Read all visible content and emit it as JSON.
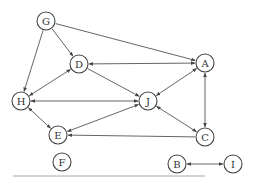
{
  "diagram": {
    "type": "directed-graph",
    "node_radius": 9,
    "colors": {
      "stroke": "#444444",
      "edge": "#555555",
      "text": "#333333",
      "divider": "#aaaaaa",
      "background": "#ffffff"
    },
    "nodes": [
      {
        "id": "G",
        "label": "G",
        "x": 46,
        "y": 21
      },
      {
        "id": "D",
        "label": "D",
        "x": 79,
        "y": 64
      },
      {
        "id": "A",
        "label": "A",
        "x": 205,
        "y": 63
      },
      {
        "id": "H",
        "label": "H",
        "x": 21,
        "y": 101
      },
      {
        "id": "J",
        "label": "J",
        "x": 148,
        "y": 101
      },
      {
        "id": "E",
        "label": "E",
        "x": 58,
        "y": 135
      },
      {
        "id": "C",
        "label": "C",
        "x": 205,
        "y": 137
      },
      {
        "id": "F",
        "label": "F",
        "x": 62,
        "y": 162
      },
      {
        "id": "B",
        "label": "B",
        "x": 177,
        "y": 164
      },
      {
        "id": "I",
        "label": "I",
        "x": 233,
        "y": 164
      }
    ],
    "edges": [
      {
        "from": "G",
        "to": "D",
        "bidirectional": false
      },
      {
        "from": "G",
        "to": "H",
        "bidirectional": false
      },
      {
        "from": "G",
        "to": "A",
        "bidirectional": false
      },
      {
        "from": "A",
        "to": "D",
        "bidirectional": true
      },
      {
        "from": "D",
        "to": "J",
        "bidirectional": false
      },
      {
        "from": "A",
        "to": "J",
        "bidirectional": true
      },
      {
        "from": "J",
        "to": "H",
        "bidirectional": true
      },
      {
        "from": "D",
        "to": "H",
        "bidirectional": true
      },
      {
        "from": "H",
        "to": "E",
        "bidirectional": true
      },
      {
        "from": "J",
        "to": "E",
        "bidirectional": true
      },
      {
        "from": "C",
        "to": "E",
        "bidirectional": false
      },
      {
        "from": "A",
        "to": "C",
        "bidirectional": true
      },
      {
        "from": "J",
        "to": "C",
        "bidirectional": true
      },
      {
        "from": "B",
        "to": "I",
        "bidirectional": true
      }
    ],
    "divider": {
      "x1": 13,
      "y1": 176,
      "x2": 205,
      "y2": 176
    }
  }
}
